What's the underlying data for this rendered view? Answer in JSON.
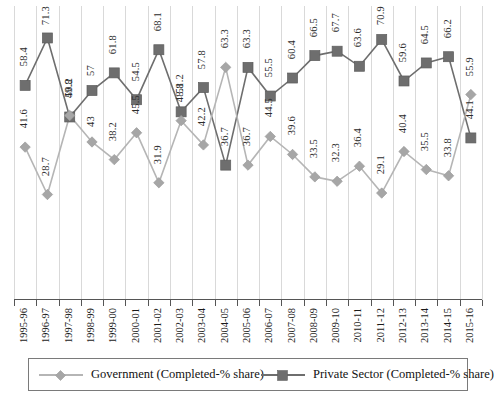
{
  "chart_data": {
    "type": "line",
    "title": "",
    "xlabel": "",
    "ylabel": "",
    "ylim": [
      0,
      80
    ],
    "grid": "vertical",
    "legend_position": "bottom",
    "categories": [
      "1995-96",
      "1996-97",
      "1997-98",
      "1998-99",
      "1999-00",
      "2000-01",
      "2001-02",
      "2002-03",
      "2003-04",
      "2004-05",
      "2005-06",
      "2006-07",
      "2007-08",
      "2008-09",
      "2009-10",
      "2010-11",
      "2011-12",
      "2012-13",
      "2013-14",
      "2014-15",
      "2015-16"
    ],
    "series": [
      {
        "name": "Government (Completed-% share)",
        "marker": "diamond",
        "color": "#a6a6a6",
        "values": [
          41.6,
          28.7,
          50.2,
          43,
          38.2,
          45.5,
          31.9,
          48.8,
          42.2,
          63.3,
          36.7,
          44.5,
          39.6,
          33.5,
          32.3,
          36.4,
          29.1,
          40.4,
          35.5,
          33.8,
          55.9
        ]
      },
      {
        "name": "Private Sector (Completed-% share)",
        "marker": "square",
        "color": "#6e6e6e",
        "values": [
          58.4,
          71.3,
          49.8,
          57,
          61.8,
          54.5,
          68.1,
          51.2,
          57.8,
          36.7,
          63.3,
          55.5,
          60.4,
          66.5,
          67.7,
          63.6,
          70.9,
          59.6,
          64.5,
          66.2,
          44.1
        ]
      }
    ]
  },
  "legend": {
    "government_label": "Government (Completed-% share)",
    "private_label": "Private Sector (Completed-% share)"
  },
  "caption": {
    "text": ""
  },
  "colors": {
    "government": "#a6a6a6",
    "private": "#6e6e6e",
    "gridline": "#d9d9d9",
    "axis": "#555555"
  }
}
